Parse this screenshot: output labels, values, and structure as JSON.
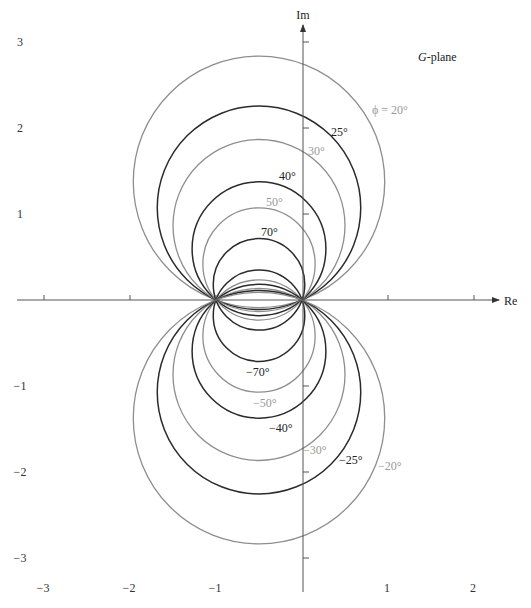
{
  "diagram": {
    "title_label": "G-plane",
    "title_italic": "G",
    "title_rest": "-plane",
    "axes": {
      "x_label": "Re",
      "y_label": "Im",
      "x_ticks": [
        -3,
        -2,
        -1,
        1,
        2
      ],
      "y_ticks": [
        3,
        2,
        1,
        -1,
        -2,
        -3
      ],
      "x_tick_labels": [
        "−3",
        "−2",
        "−1",
        "1",
        "2"
      ],
      "y_tick_labels": [
        "3",
        "2",
        "1",
        "−1",
        "−2",
        "−3"
      ],
      "origin_px": [
        302,
        300
      ],
      "scale_px_per_unit": 86
    },
    "colors": {
      "black_curve": "#2a2a2a",
      "gray_curve": "#8e8e8e",
      "axis": "#555555",
      "black_label": "#222222",
      "gray_label": "#999999"
    },
    "circles": [
      {
        "phi": 20,
        "color": "gray",
        "label": "ϕ = 20°",
        "label_pos": [
          372,
          114
        ]
      },
      {
        "phi": 25,
        "color": "black",
        "label": "25°",
        "label_pos": [
          331,
          136
        ]
      },
      {
        "phi": 30,
        "color": "gray",
        "label": "30°",
        "label_pos": [
          308,
          155
        ]
      },
      {
        "phi": 40,
        "color": "black",
        "label": "40°",
        "label_pos": [
          279,
          180
        ]
      },
      {
        "phi": 50,
        "color": "gray",
        "label": "50°",
        "label_pos": [
          266,
          206
        ]
      },
      {
        "phi": 70,
        "color": "black",
        "label": "70°",
        "label_pos": [
          261,
          236
        ]
      },
      {
        "phi": -70,
        "color": "black",
        "label": "−70°",
        "label_pos": [
          246,
          376
        ]
      },
      {
        "phi": -50,
        "color": "gray",
        "label": "−50°",
        "label_pos": [
          253,
          407
        ]
      },
      {
        "phi": -40,
        "color": "black",
        "label": "−40°",
        "label_pos": [
          269,
          432
        ]
      },
      {
        "phi": -30,
        "color": "gray",
        "label": "−30°",
        "label_pos": [
          303,
          454
        ]
      },
      {
        "phi": -25,
        "color": "black",
        "label": "−25°",
        "label_pos": [
          339,
          464
        ]
      },
      {
        "phi": -20,
        "color": "gray",
        "label": "−20°",
        "label_pos": [
          378,
          470
        ]
      }
    ]
  }
}
